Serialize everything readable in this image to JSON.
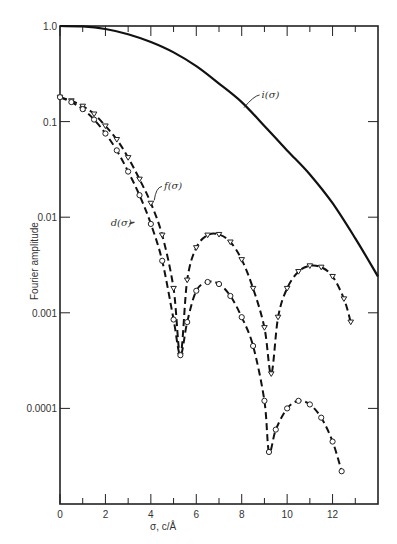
{
  "chart_data": {
    "type": "line",
    "title": "",
    "xlabel": "σ, c/Å",
    "ylabel": "Fourier amplitude",
    "xlim": [
      0,
      14
    ],
    "ylim": [
      1e-05,
      1.0
    ],
    "yscale": "log",
    "grid": false,
    "legend": "inline labels",
    "x_ticks": [
      0,
      2,
      4,
      6,
      8,
      10,
      12
    ],
    "x_minor_ticks": [
      1,
      3,
      5,
      7,
      9,
      11,
      13
    ],
    "y_ticks": [
      {
        "value": 1.0,
        "label": "1.0"
      },
      {
        "value": 0.1,
        "label": "0.1"
      },
      {
        "value": 0.01,
        "label": "0.01"
      },
      {
        "value": 0.001,
        "label": "0.001"
      },
      {
        "value": 0.0001,
        "label": "0.0001"
      }
    ],
    "series": [
      {
        "name": "i(σ)",
        "style": "solid",
        "marker": "none",
        "x": [
          0,
          1,
          2,
          3,
          4,
          5,
          6,
          7,
          8,
          9,
          10,
          11,
          12,
          13,
          14
        ],
        "y": [
          1.0,
          0.99,
          0.93,
          0.82,
          0.68,
          0.53,
          0.38,
          0.25,
          0.16,
          0.09,
          0.05,
          0.028,
          0.014,
          0.006,
          0.0024
        ]
      },
      {
        "name": "f(σ)",
        "style": "dashed",
        "marker": "triangle",
        "x": [
          0,
          0.5,
          1,
          1.5,
          2,
          2.5,
          3,
          3.5,
          4,
          4.5,
          5,
          5.3,
          5.6,
          6,
          6.5,
          7,
          7.5,
          8,
          8.5,
          9,
          9.3,
          9.6,
          10,
          10.5,
          11,
          11.5,
          12,
          12.5,
          12.8
        ],
        "y": [
          0.18,
          0.165,
          0.145,
          0.12,
          0.09,
          0.065,
          0.042,
          0.025,
          0.014,
          0.0065,
          0.0018,
          0.00036,
          0.0022,
          0.0048,
          0.0065,
          0.0066,
          0.0055,
          0.0036,
          0.0018,
          0.0007,
          0.00023,
          0.0009,
          0.0018,
          0.0027,
          0.0031,
          0.003,
          0.0024,
          0.0014,
          0.0008
        ]
      },
      {
        "name": "d(σ)",
        "style": "dashed",
        "marker": "circle",
        "x": [
          0,
          0.5,
          1,
          1.5,
          2,
          2.5,
          3,
          3.5,
          4,
          4.5,
          5,
          5.3,
          5.6,
          6,
          6.5,
          7,
          7.5,
          8,
          8.5,
          9,
          9.2,
          9.5,
          10,
          10.5,
          11,
          11.5,
          12,
          12.4
        ],
        "y": [
          0.18,
          0.16,
          0.135,
          0.105,
          0.075,
          0.05,
          0.03,
          0.017,
          0.0085,
          0.0035,
          0.00085,
          0.00036,
          0.0008,
          0.0017,
          0.0021,
          0.002,
          0.0015,
          0.0009,
          0.00045,
          0.00012,
          3.5e-05,
          6e-05,
          0.0001,
          0.00012,
          0.00011,
          8e-05,
          4.5e-05,
          2.2e-05
        ]
      }
    ],
    "annotations": [
      {
        "text": "i(σ)",
        "x": 8.7,
        "y": 0.19
      },
      {
        "text": "f(σ)",
        "x": 4.4,
        "y": 0.021
      },
      {
        "text": "d(σ)",
        "x": 3.2,
        "y": 0.0088
      }
    ]
  }
}
